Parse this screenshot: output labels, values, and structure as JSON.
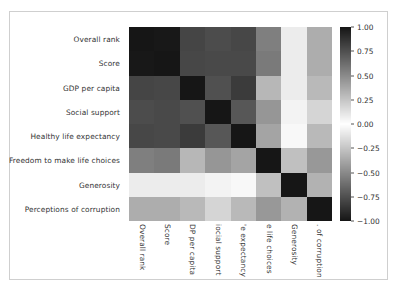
{
  "chart_data": {
    "type": "heatmap",
    "title": "",
    "xlabel": "",
    "ylabel": "",
    "cmap": "diverging-gray (|value| -> dark)",
    "vmin": -1.0,
    "vmax": 1.0,
    "grid": false,
    "legend_position": "right",
    "row_labels": [
      "Overall rank",
      "Score",
      "GDP per capita",
      "Social support",
      "Healthy life expectancy",
      "Freedom to make life choices",
      "Generosity",
      "Perceptions of corruption"
    ],
    "column_labels_displayed": [
      "Overall rank",
      "Score",
      "DP per capita",
      "iocial support",
      "'e expectancy",
      "е life choices",
      "Generosity",
      ". of corruption"
    ],
    "column_labels_full": [
      "Overall rank",
      "Score",
      "GDP per capita",
      "Social support",
      "Healthy life expectancy",
      "Freedom to make life choices",
      "Generosity",
      "Perceptions of corruption"
    ],
    "values": [
      [
        1.0,
        -0.99,
        -0.8,
        -0.77,
        -0.79,
        -0.55,
        -0.08,
        0.35
      ],
      [
        -0.99,
        1.0,
        0.79,
        0.78,
        0.78,
        0.57,
        0.08,
        -0.35
      ],
      [
        -0.8,
        0.79,
        1.0,
        0.75,
        0.84,
        0.31,
        -0.08,
        -0.3
      ],
      [
        -0.77,
        0.78,
        0.75,
        1.0,
        0.72,
        0.45,
        -0.05,
        -0.18
      ],
      [
        -0.79,
        0.78,
        0.84,
        0.72,
        1.0,
        0.39,
        -0.03,
        -0.3
      ],
      [
        -0.55,
        0.57,
        0.31,
        0.45,
        0.39,
        1.0,
        0.27,
        0.44
      ],
      [
        -0.08,
        0.08,
        -0.08,
        -0.05,
        -0.03,
        0.27,
        1.0,
        0.33
      ],
      [
        0.35,
        -0.35,
        -0.3,
        -0.18,
        -0.3,
        0.44,
        0.33,
        1.0
      ]
    ],
    "colorbar": {
      "ticks": [
        1.0,
        0.75,
        0.5,
        0.25,
        0.0,
        -0.25,
        -0.5,
        -0.75,
        -1.0
      ],
      "tick_labels": [
        "1.00",
        "0.75",
        "0.50",
        "0.25",
        "0.00",
        "−0.25",
        "−0.50",
        "−0.75",
        "−1.00"
      ],
      "orientation": "vertical"
    }
  },
  "figure": {
    "background_color": "#ffffff",
    "frame_color": "#cfcfcf",
    "text_color": "#333333"
  }
}
